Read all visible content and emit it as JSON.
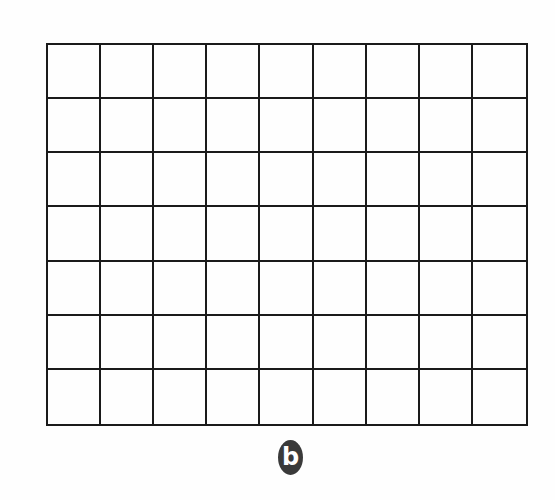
{
  "figure": {
    "label": "b",
    "label_badge_color": "#3a3a3a",
    "label_text_color": "#ffffff"
  },
  "grid": {
    "columns": 9,
    "rows": 7,
    "line_color": "#1a1a1a",
    "cells_filled": false
  }
}
